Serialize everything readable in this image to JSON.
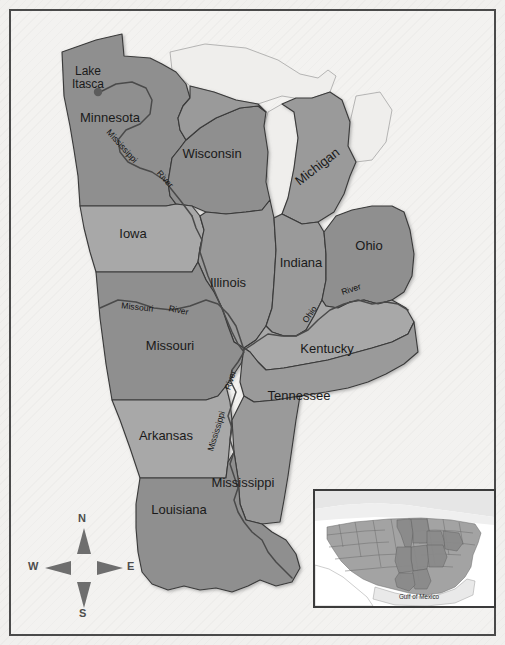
{
  "figure": {
    "type": "reference-map"
  },
  "colors": {
    "background": "#f1f0ee",
    "frame_border": "#4a4a4a",
    "state_fill_dark": "#8f8f8f",
    "state_fill_light": "#a8a8a8",
    "state_fill_mid": "#9a9a9a",
    "water_fill": "#efeeec",
    "boundary_stroke": "#3a3a3a",
    "river_stroke": "#4a4a4a",
    "compass_arrow": "#6e6e6e",
    "inset_land": "#a3a3a3",
    "inset_water": "#ffffff",
    "inset_frame": "#3b3b3b",
    "label_text": "#1a1a1a"
  },
  "states": [
    {
      "name": "Minnesota",
      "label_x": 110,
      "label_y": 122,
      "rotate": 0,
      "anchor": "middle"
    },
    {
      "name": "Wisconsin",
      "label_x": 212,
      "label_y": 158,
      "rotate": 0,
      "anchor": "middle"
    },
    {
      "name": "Michigan",
      "label_x": 320,
      "label_y": 170,
      "rotate": -38,
      "anchor": "middle"
    },
    {
      "name": "Iowa",
      "label_x": 133,
      "label_y": 238,
      "rotate": 0,
      "anchor": "middle"
    },
    {
      "name": "Illinois",
      "label_x": 228,
      "label_y": 287,
      "rotate": 0,
      "anchor": "middle"
    },
    {
      "name": "Indiana",
      "label_x": 301,
      "label_y": 267,
      "rotate": 0,
      "anchor": "middle"
    },
    {
      "name": "Ohio",
      "label_x": 369,
      "label_y": 250,
      "rotate": 0,
      "anchor": "middle"
    },
    {
      "name": "Missouri",
      "label_x": 170,
      "label_y": 350,
      "rotate": 0,
      "anchor": "middle"
    },
    {
      "name": "Kentucky",
      "label_x": 327,
      "label_y": 353,
      "rotate": 0,
      "anchor": "middle"
    },
    {
      "name": "Tennessee",
      "label_x": 299,
      "label_y": 400,
      "rotate": 0,
      "anchor": "middle"
    },
    {
      "name": "Arkansas",
      "label_x": 166,
      "label_y": 440,
      "rotate": 0,
      "anchor": "middle"
    },
    {
      "name": "Mississippi",
      "label_x": 243,
      "label_y": 487,
      "rotate": 0,
      "anchor": "middle"
    },
    {
      "name": "Louisiana",
      "label_x": 179,
      "label_y": 514,
      "rotate": 0,
      "anchor": "middle"
    }
  ],
  "places": [
    {
      "name": "Lake Itasca",
      "line1": "Lake",
      "line2": "Itasca",
      "label_x": 88,
      "label_y": 75,
      "dot_x": 98,
      "dot_y": 92
    }
  ],
  "rivers": [
    {
      "name": "Mississippi River",
      "segment": "Mississippi",
      "label_x": 120,
      "label_y": 148,
      "rotate": 48
    },
    {
      "name": "Mississippi River",
      "segment": "River",
      "label_x": 163,
      "label_y": 181,
      "rotate": 48
    },
    {
      "name": "Missouri River",
      "segment": "Missouri",
      "label_x": 137,
      "label_y": 310,
      "rotate": 6
    },
    {
      "name": "Missouri River",
      "segment": "River",
      "label_x": 178,
      "label_y": 313,
      "rotate": 12
    },
    {
      "name": "Ohio River",
      "segment": "Ohio",
      "label_x": 312,
      "label_y": 316,
      "rotate": -55
    },
    {
      "name": "Ohio River",
      "segment": "River",
      "label_x": 352,
      "label_y": 292,
      "rotate": -18
    },
    {
      "name": "Mississippi River",
      "segment": "River",
      "label_x": 233,
      "label_y": 381,
      "rotate": -72
    },
    {
      "name": "Mississippi River",
      "segment": "Mississippi",
      "label_x": 219,
      "label_y": 432,
      "rotate": -73
    }
  ],
  "compass": {
    "north": "N",
    "south": "S",
    "east": "E",
    "west": "W"
  },
  "inset": {
    "title": "United States locator map",
    "water_label": "Gulf of Mexico",
    "highlighted_region": "Mississippi River Basin states"
  }
}
